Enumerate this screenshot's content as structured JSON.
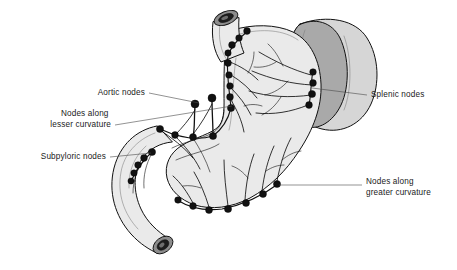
{
  "figure": {
    "background_color": "#ffffff",
    "width": 457,
    "height": 270
  },
  "palette": {
    "outline": "#111111",
    "node_fill": "#111111",
    "organ_light": "#eaeaea",
    "organ_mid": "#d6d6d6",
    "organ_dark": "#a9a9a9",
    "leader_line": "#4a4a4a",
    "text": "#1a1a1a",
    "lumen_dark": "#1d1d1d",
    "lumen_mid": "#8c8c8c"
  },
  "labels": [
    {
      "id": "aortic-nodes",
      "side": "left",
      "lines": [
        "Aortic nodes"
      ],
      "text_x": 145,
      "text_y": 95,
      "leader": "M149,93 L199,103"
    },
    {
      "id": "nodes-lesser-curvature",
      "side": "left",
      "lines": [
        "Nodes along",
        "lesser curvature"
      ],
      "text_x": 111,
      "text_y": 116,
      "leader": "M115,125 L232,106"
    },
    {
      "id": "subpyloric-nodes",
      "side": "left",
      "lines": [
        "Subpyloric nodes"
      ],
      "text_x": 106,
      "text_y": 159,
      "leader": "M110,157 L151,153"
    },
    {
      "id": "splenic-nodes",
      "side": "right",
      "lines": [
        "Splenic nodes"
      ],
      "text_x": 371,
      "text_y": 97,
      "leader": "M367,95 L312,88"
    },
    {
      "id": "nodes-greater-curvature",
      "side": "right",
      "lines": [
        "Nodes along",
        "greater curvature"
      ],
      "text_x": 366,
      "text_y": 184,
      "leader": "M362,185 L279,185"
    }
  ],
  "organs": [
    {
      "id": "esophagus",
      "name": "Esophagus"
    },
    {
      "id": "stomach",
      "name": "Stomach"
    },
    {
      "id": "duodenum",
      "name": "Duodenum"
    },
    {
      "id": "spleen",
      "name": "Spleen"
    }
  ],
  "node_chains": [
    {
      "id": "lesser-curvature-chain",
      "label_ref": "nodes-lesser-curvature",
      "node_count": 13,
      "nodes": [
        {
          "cx": 247,
          "cy": 31,
          "r": 3.4
        },
        {
          "cx": 239,
          "cy": 38,
          "r": 3.3
        },
        {
          "cx": 232,
          "cy": 45,
          "r": 3.4
        },
        {
          "cx": 228,
          "cy": 53,
          "r": 3.2
        },
        {
          "cx": 228,
          "cy": 63,
          "r": 3.4
        },
        {
          "cx": 229,
          "cy": 75,
          "r": 3.3
        },
        {
          "cx": 230,
          "cy": 86,
          "r": 3.3
        },
        {
          "cx": 230,
          "cy": 97,
          "r": 3.4
        },
        {
          "cx": 231,
          "cy": 108,
          "r": 3.6
        },
        {
          "cx": 213,
          "cy": 136,
          "r": 3.6
        },
        {
          "cx": 193,
          "cy": 137,
          "r": 3.5
        },
        {
          "cx": 175,
          "cy": 135,
          "r": 3.4
        },
        {
          "cx": 160,
          "cy": 129,
          "r": 3.6
        }
      ]
    },
    {
      "id": "aortic-chain",
      "label_ref": "aortic-nodes",
      "node_count": 2,
      "nodes": [
        {
          "cx": 195,
          "cy": 104,
          "r": 4.0
        },
        {
          "cx": 212,
          "cy": 98,
          "r": 4.0
        }
      ]
    },
    {
      "id": "splenic-chain",
      "label_ref": "splenic-nodes",
      "node_count": 4,
      "nodes": [
        {
          "cx": 313,
          "cy": 72,
          "r": 3.3
        },
        {
          "cx": 313,
          "cy": 83,
          "r": 3.4
        },
        {
          "cx": 312,
          "cy": 94,
          "r": 3.6
        },
        {
          "cx": 309,
          "cy": 105,
          "r": 3.4
        }
      ]
    },
    {
      "id": "greater-curvature-chain",
      "label_ref": "nodes-greater-curvature",
      "node_count": 7,
      "nodes": [
        {
          "cx": 277,
          "cy": 184,
          "r": 3.6
        },
        {
          "cx": 263,
          "cy": 194,
          "r": 3.5
        },
        {
          "cx": 246,
          "cy": 203,
          "r": 3.5
        },
        {
          "cx": 228,
          "cy": 209,
          "r": 3.6
        },
        {
          "cx": 209,
          "cy": 210,
          "r": 3.5
        },
        {
          "cx": 193,
          "cy": 206,
          "r": 3.4
        },
        {
          "cx": 178,
          "cy": 200,
          "r": 3.3
        }
      ]
    },
    {
      "id": "subpyloric-chain",
      "label_ref": "subpyloric-nodes",
      "node_count": 5,
      "nodes": [
        {
          "cx": 152,
          "cy": 152,
          "r": 3.6
        },
        {
          "cx": 144,
          "cy": 158,
          "r": 3.4
        },
        {
          "cx": 138,
          "cy": 165,
          "r": 3.3
        },
        {
          "cx": 134,
          "cy": 173,
          "r": 3.2
        },
        {
          "cx": 131,
          "cy": 181,
          "r": 3.1
        }
      ]
    }
  ]
}
